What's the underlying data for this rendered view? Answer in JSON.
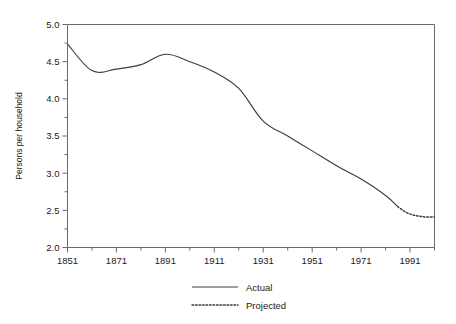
{
  "chart_data": {
    "type": "line",
    "title": "",
    "xlabel": "",
    "ylabel": "Persons per household",
    "xlim": [
      1851,
      2001
    ],
    "ylim": [
      2.0,
      5.0
    ],
    "grid": false,
    "legend_position": "bottom-center",
    "x_tick_labels": [
      "1851",
      "1871",
      "1891",
      "1911",
      "1931",
      "1951",
      "1971",
      "1991"
    ],
    "x_tick_values": [
      1851,
      1871,
      1891,
      1911,
      1931,
      1951,
      1971,
      1991
    ],
    "x_minor_step": 10,
    "y_tick_labels": [
      "2.0",
      "2.5",
      "3.0",
      "3.5",
      "4.0",
      "4.5",
      "5.0"
    ],
    "y_tick_values": [
      2.0,
      2.5,
      3.0,
      3.5,
      4.0,
      4.5,
      5.0
    ],
    "y_minor_step": 0.25,
    "series": [
      {
        "name": "Actual",
        "style": "solid",
        "color": "#3c3c3c",
        "x": [
          1851,
          1861,
          1871,
          1881,
          1891,
          1901,
          1911,
          1921,
          1931,
          1941,
          1951,
          1961,
          1971,
          1981,
          1986
        ],
        "values": [
          4.74,
          4.38,
          4.4,
          4.46,
          4.6,
          4.5,
          4.36,
          4.14,
          3.7,
          3.5,
          3.3,
          3.1,
          2.92,
          2.7,
          2.55
        ]
      },
      {
        "name": "Projected",
        "style": "dotted",
        "color": "#3c3c3c",
        "x": [
          1986,
          1989,
          1992,
          1995,
          1998,
          2001
        ],
        "values": [
          2.55,
          2.48,
          2.44,
          2.42,
          2.41,
          2.41
        ]
      }
    ]
  },
  "legend": {
    "entries": [
      {
        "label": "Actual",
        "style": "solid"
      },
      {
        "label": "Projected",
        "style": "dotted"
      }
    ]
  }
}
